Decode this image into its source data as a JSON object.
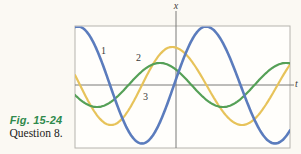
{
  "caption": {
    "figure_label": "Fig. 15-24",
    "question_label": "Question 8.",
    "figure_label_color": "#2f8a4c"
  },
  "chart_data": {
    "type": "line",
    "title": "",
    "xlabel": "t",
    "ylabel": "x",
    "x_axis": {
      "label": "t",
      "ticks": [],
      "numeric_labels": false
    },
    "y_axis": {
      "label": "x",
      "ticks": [],
      "numeric_labels": false
    },
    "grid": false,
    "legend": "inline numeric labels 1, 2, 3 next to curves",
    "series": [
      {
        "name": "1",
        "color": "#5b7cbd",
        "relative_amplitude": 1.0,
        "amplitude": 58.5,
        "center_y": 85,
        "max_at_x": 206,
        "period_left": 128,
        "period_right": 138,
        "width": 2.6,
        "z": 3
      },
      {
        "name": "2",
        "color": "#55a057",
        "relative_amplitude": 0.38,
        "amplitude": 22,
        "center_y": 85,
        "max_at_x": 160,
        "period_left": 126,
        "period_right": 126,
        "width": 2.2,
        "z": 2
      },
      {
        "name": "3",
        "color": "#e7c35a",
        "relative_amplitude": 0.67,
        "amplitude": 39,
        "center_y": 86,
        "max_at_x": 172,
        "period_left": 122,
        "period_right": 140,
        "width": 2.2,
        "z": 1
      }
    ],
    "layout_px": {
      "frame": {
        "left": 75,
        "top": 26,
        "right": 290,
        "bottom": 148,
        "fill": "#fffefb",
        "stroke": "#b6b4ae"
      },
      "y_axis_line": {
        "x": 176,
        "top": 11,
        "bottom": 148
      },
      "x_axis_line": {
        "y": 85,
        "left": 75,
        "right": 294
      },
      "axis_color": "#7a7a78"
    }
  }
}
